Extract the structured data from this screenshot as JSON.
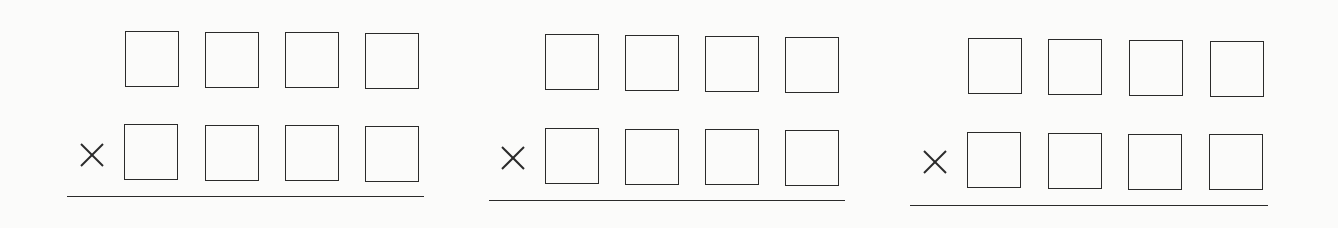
{
  "worksheet": {
    "type": "multiplication",
    "operator_symbol": "×",
    "problems": [
      {
        "id": 1,
        "top_row": [
          "",
          "",
          "",
          ""
        ],
        "bottom_row": [
          "",
          "",
          "",
          ""
        ],
        "operator": "×"
      },
      {
        "id": 2,
        "top_row": [
          "",
          "",
          "",
          ""
        ],
        "bottom_row": [
          "",
          "",
          "",
          ""
        ],
        "operator": "×"
      },
      {
        "id": 3,
        "top_row": [
          "",
          "",
          "",
          ""
        ],
        "bottom_row": [
          "",
          "",
          "",
          ""
        ],
        "operator": "×"
      }
    ]
  },
  "colors": {
    "background": "#fbfbfa",
    "ink": "#2a2a2a"
  }
}
